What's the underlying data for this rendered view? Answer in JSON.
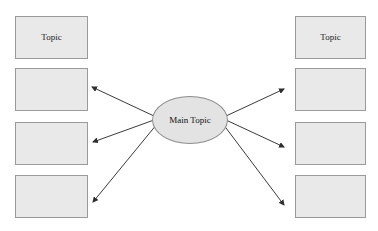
{
  "diagram": {
    "type": "radial-concept-map",
    "title": "",
    "center": {
      "label": "Main Topic",
      "shape": "ellipse",
      "fill": "#e3e3e3",
      "stroke": "#8e8e8e",
      "x": 152,
      "y": 96,
      "width": 76,
      "height": 48
    },
    "box_fill": "#e9e9e9",
    "box_stroke": "#9a9a9a",
    "arrow_color": "#3a3a3a",
    "left_boxes": [
      {
        "label": "Topic",
        "x": 15,
        "y": 16,
        "width": 73,
        "height": 43
      },
      {
        "label": "",
        "x": 15,
        "y": 68,
        "width": 73,
        "height": 43
      },
      {
        "label": "",
        "x": 15,
        "y": 122,
        "width": 73,
        "height": 43
      },
      {
        "label": "",
        "x": 15,
        "y": 175,
        "width": 73,
        "height": 43
      }
    ],
    "right_boxes": [
      {
        "label": "Topic",
        "x": 295,
        "y": 16,
        "width": 71,
        "height": 43
      },
      {
        "label": "",
        "x": 295,
        "y": 68,
        "width": 71,
        "height": 43
      },
      {
        "label": "",
        "x": 295,
        "y": 122,
        "width": 71,
        "height": 43
      },
      {
        "label": "",
        "x": 295,
        "y": 175,
        "width": 71,
        "height": 43
      }
    ],
    "arrows": [
      {
        "name": "arrow-left-upper",
        "x1": 154,
        "y1": 116,
        "x2": 92,
        "y2": 87
      },
      {
        "name": "arrow-left-middle",
        "x1": 154,
        "y1": 120,
        "x2": 93,
        "y2": 142
      },
      {
        "name": "arrow-left-lower",
        "x1": 157,
        "y1": 124,
        "x2": 93,
        "y2": 202
      },
      {
        "name": "arrow-right-upper",
        "x1": 226,
        "y1": 116,
        "x2": 284,
        "y2": 89
      },
      {
        "name": "arrow-right-middle",
        "x1": 226,
        "y1": 120,
        "x2": 284,
        "y2": 147
      },
      {
        "name": "arrow-right-lower",
        "x1": 223,
        "y1": 124,
        "x2": 284,
        "y2": 205
      }
    ]
  }
}
